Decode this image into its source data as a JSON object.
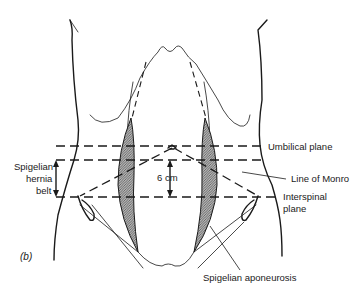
{
  "figure": {
    "panel_label": "(b)",
    "labels": {
      "umbilical_plane": "Umbilical plane",
      "line_of_monro": "Line of Monro",
      "interspinal_plane_line1": "Interspinal",
      "interspinal_plane_line2": "plane",
      "spigelian_hernia_belt_line1": "Spigelian",
      "spigelian_hernia_belt_line2": "hernia",
      "spigelian_hernia_belt_line3": "belt",
      "distance": "6 cm",
      "spigelian_aponeurosis": "Spigelian aponeurosis"
    },
    "colors": {
      "ink": "#1a1a1a",
      "background": "#ffffff",
      "hatch_fill": "#8a8a8a"
    }
  }
}
